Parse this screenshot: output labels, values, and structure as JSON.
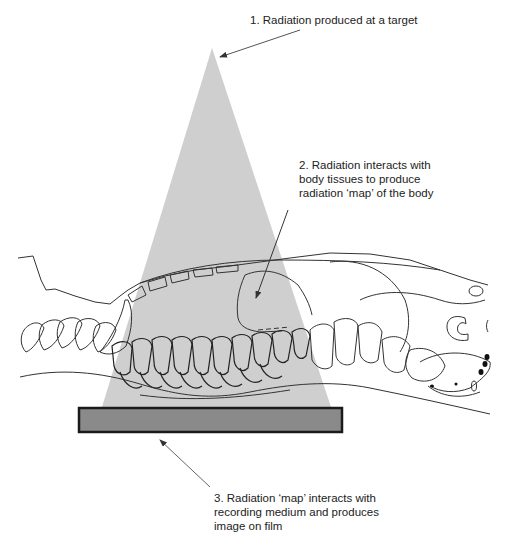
{
  "diagram": {
    "colors": {
      "beam": "#cfcfcf",
      "film_fill": "#8a8a8a",
      "film_border": "#1a1a1a",
      "outline": "#333333",
      "arrow": "#333333"
    },
    "labels": [
      {
        "id": "target",
        "lines": [
          "1. Radiation produced at a target"
        ]
      },
      {
        "id": "tissue_interaction",
        "lines": [
          "2. Radiation interacts with",
          "body tissues to produce",
          "radiation ‘map’ of the body"
        ]
      },
      {
        "id": "film",
        "lines": [
          "3.  Radiation ‘map’  interacts with",
          "recording medium and produces",
          "image on film"
        ]
      }
    ],
    "components": {
      "beam": "x-ray-beam-cone",
      "subject": "animal-lateral-outline",
      "film": "recording-medium-film"
    }
  }
}
